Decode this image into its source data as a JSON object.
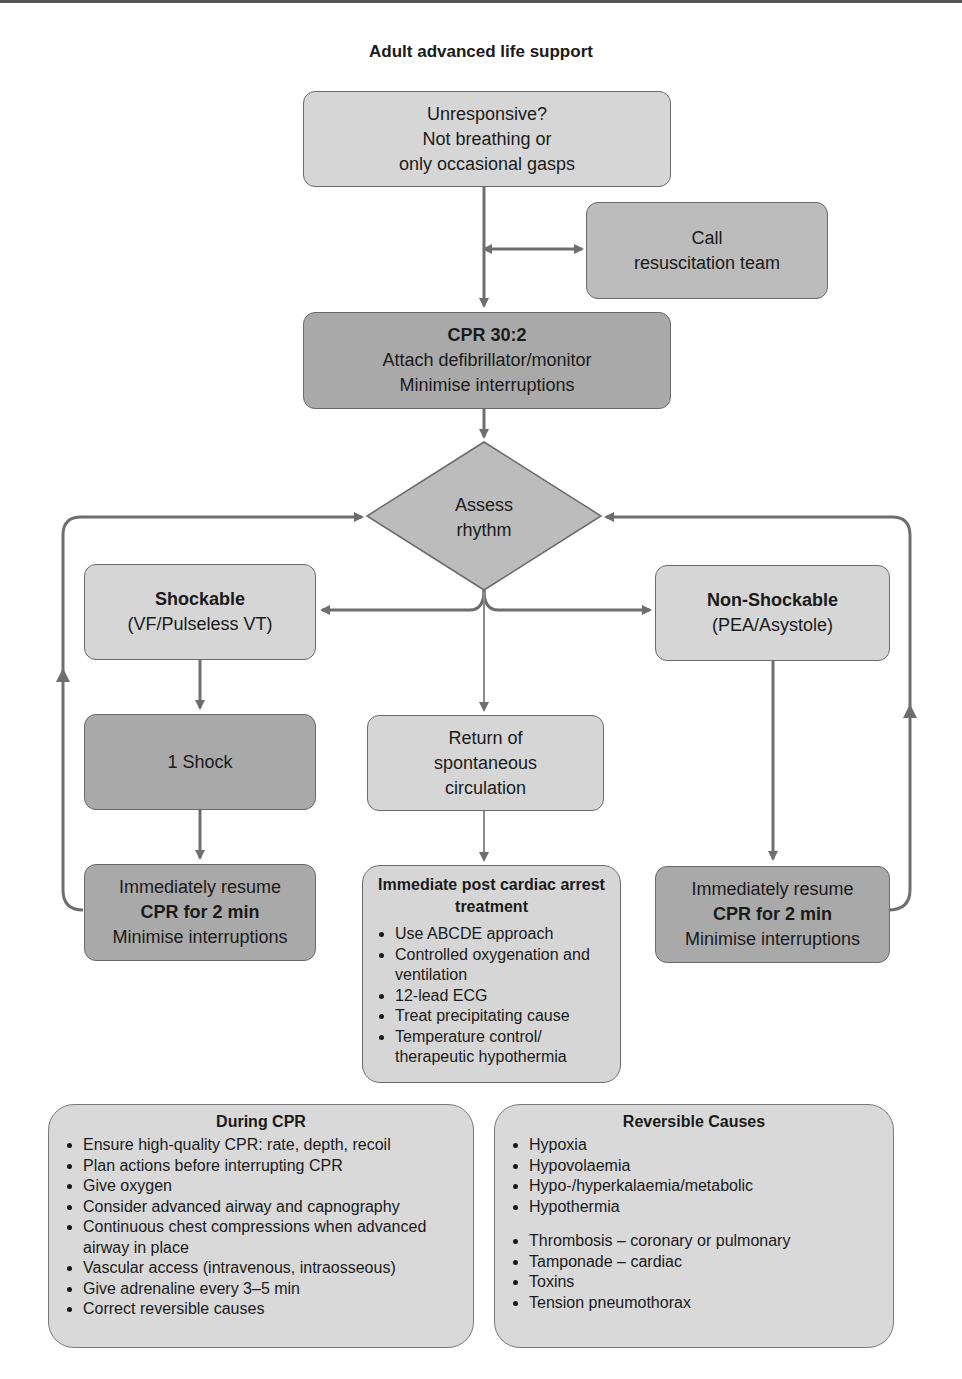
{
  "title": "Adult advanced life support",
  "nodes": {
    "unresponsive": {
      "lines": [
        "Unresponsive?",
        "Not breathing or",
        "only occasional gasps"
      ]
    },
    "call_team": {
      "lines": [
        "Call",
        "resuscitation team"
      ]
    },
    "cpr": {
      "heading": "CPR 30:2",
      "lines": [
        "Attach defibrillator/monitor",
        "Minimise interruptions"
      ]
    },
    "assess": {
      "lines": [
        "Assess",
        "rhythm"
      ]
    },
    "shockable": {
      "heading": "Shockable",
      "sub": "(VF/Pulseless VT)"
    },
    "non_shockable": {
      "heading": "Non-Shockable",
      "sub": "(PEA/Asystole)"
    },
    "shock": {
      "label": "1 Shock"
    },
    "rosc": {
      "lines": [
        "Return of",
        "spontaneous",
        "circulation"
      ]
    },
    "resume_left": {
      "line1": "Immediately resume",
      "heading": "CPR for 2 min",
      "line3": "Minimise interruptions"
    },
    "resume_right": {
      "line1": "Immediately resume",
      "heading": "CPR for 2 min",
      "line3": "Minimise interruptions"
    },
    "post_arrest": {
      "heading": "Immediate post cardiac arrest treatment",
      "items": [
        "Use ABCDE approach",
        "Controlled oxygenation and ventilation",
        "12-lead ECG",
        "Treat precipitating cause",
        "Temperature control/ therapeutic hypothermia"
      ]
    }
  },
  "during_cpr": {
    "heading": "During CPR",
    "items": [
      "Ensure high-quality CPR: rate, depth, recoil",
      "Plan actions before interrupting CPR",
      "Give oxygen",
      "Consider advanced airway and capnography",
      "Continuous chest compressions when advanced airway in place",
      "Vascular access (intravenous, intraosseous)",
      "Give adrenaline every 3–5 min",
      "Correct reversible causes"
    ]
  },
  "reversible_causes": {
    "heading": "Reversible Causes",
    "group1": [
      "Hypoxia",
      "Hypovolaemia",
      "Hypo-/hyperkalaemia/metabolic",
      "Hypothermia"
    ],
    "group2": [
      "Thrombosis – coronary or pulmonary",
      "Tamponade – cardiac",
      "Toxins",
      "Tension pneumothorax"
    ]
  },
  "colors": {
    "light_box": "#d6d6d6",
    "mid_box": "#bcbcbc",
    "dark_box": "#a9a9a9",
    "line": "#6e6e6e"
  }
}
